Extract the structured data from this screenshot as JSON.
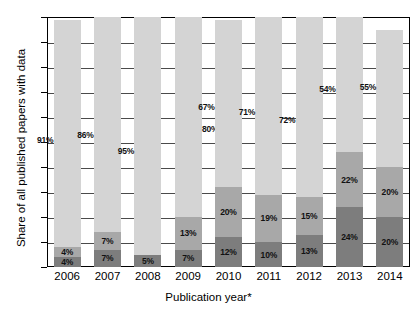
{
  "chart_data": {
    "type": "bar",
    "subtype": "stacked-bar",
    "title": "",
    "xlabel": "Publication year*",
    "ylabel": "Share of all published papers with data",
    "ylim": [
      0.0,
      1.0
    ],
    "grid": true,
    "legend_position": "none",
    "categories": [
      "2006",
      "2007",
      "2008",
      "2009",
      "2010",
      "2011",
      "2012",
      "2013",
      "2014"
    ],
    "ytick_labels": [
      "0.0",
      "0.1",
      "0.2",
      "0.3",
      "0.4",
      "0.5",
      "0.6",
      "0.7",
      "0.8",
      "0.9",
      "1.0"
    ],
    "ytick_values": [
      0.0,
      0.1,
      0.2,
      0.3,
      0.4,
      0.5,
      0.6,
      0.7,
      0.8,
      0.9,
      1.0
    ],
    "series": [
      {
        "name": "bottom-segment",
        "color": "#7d7d7d",
        "values": [
          4,
          7,
          5,
          7,
          12,
          10,
          13,
          24,
          20
        ],
        "labels": [
          "4%",
          "7%",
          "5%",
          "7%",
          "12%",
          "10%",
          "13%",
          "24%",
          "20%"
        ]
      },
      {
        "name": "middle-segment",
        "color": "#a8a8a8",
        "values": [
          4,
          7,
          0,
          13,
          20,
          19,
          15,
          22,
          20
        ],
        "labels": [
          "4%",
          "7%",
          "",
          "13%",
          "20%",
          "19%",
          "15%",
          "22%",
          "20%"
        ]
      },
      {
        "name": "top-segment",
        "color": "#d4d4d4",
        "values": [
          91,
          86,
          95,
          80,
          67,
          71,
          72,
          54,
          55
        ],
        "labels": [
          "91%",
          "86%",
          "95%",
          "80%",
          "67%",
          "71%",
          "72%",
          "54%",
          "55%"
        ]
      }
    ]
  },
  "axis": {
    "y_title": "Share of all published papers with data",
    "x_title": "Publication year*"
  },
  "colors": {
    "bottom": "#7d7d7d",
    "middle": "#a8a8a8",
    "top": "#d4d4d4",
    "axis": "#000000",
    "grid": "#4a4a4a",
    "background": "#ffffff"
  }
}
